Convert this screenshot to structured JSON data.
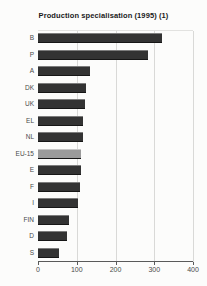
{
  "chart_data": {
    "type": "bar",
    "orientation": "horizontal",
    "title": "Production specialisation (1995) (1)",
    "categories": [
      "B",
      "P",
      "A",
      "DK",
      "UK",
      "EL",
      "NL",
      "EU-15",
      "E",
      "F",
      "I",
      "FIN",
      "D",
      "S"
    ],
    "values": [
      320,
      285,
      135,
      125,
      120,
      117,
      115,
      112,
      110,
      108,
      103,
      80,
      74,
      55
    ],
    "xlabel": "",
    "ylabel": "",
    "xlim": [
      0,
      400
    ],
    "xticks": [
      0,
      100,
      200,
      300,
      400
    ],
    "grid": "vertical",
    "legend": "none",
    "highlight_category": "EU-15",
    "colors": {
      "bar": "#333333",
      "bar_top_highlight": "#7d7d7d",
      "highlight_bar": "#9b9b9b",
      "highlight_bar_top": "#c6c6c6",
      "grid": "#d9d9d7",
      "axis": "#5a5a5a",
      "label_text": "#4a4a4a",
      "title_text": "#1a1a1a",
      "background": "#fcfcfb"
    }
  }
}
